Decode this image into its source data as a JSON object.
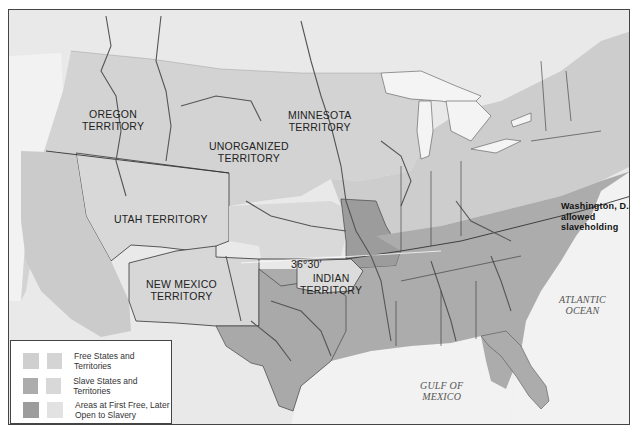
{
  "map": {
    "title_regions": {
      "oregon": "OREGON\nTERRITORY",
      "unorganized": "UNORGANIZED\nTERRITORY",
      "minnesota": "MINNESOTA\nTERRITORY",
      "utah": "UTAH TERRITORY",
      "new_mexico": "NEW MEXICO\nTERRITORY",
      "indian": "INDIAN\nTERRITORY"
    },
    "labels": {
      "oregon_line1": "OREGON",
      "oregon_line2": "TERRITORY",
      "unorganized_line1": "UNORGANIZED",
      "unorganized_line2": "TERRITORY",
      "minnesota_line1": "MINNESOTA",
      "minnesota_line2": "TERRITORY",
      "utah": "UTAH TERRITORY",
      "new_mexico_line1": "NEW MEXICO",
      "new_mexico_line2": "TERRITORY",
      "indian_line1": "INDIAN",
      "indian_line2": "TERRITORY",
      "latitude_line": "36°30′",
      "dc_note_line1": "Washington, D.C.,",
      "dc_note_line2": "allowed",
      "dc_note_line3": "slaveholding",
      "atlantic_line1": "ATLANTIC",
      "atlantic_line2": "OCEAN",
      "gulf_line1": "GULF OF",
      "gulf_line2": "MEXICO"
    },
    "colors": {
      "frame_background": "#e9e9e9",
      "foreign_land": "#e4e4e4",
      "water": "#f2f2f2",
      "free_states": "#cfcfcf",
      "free_territories": "#d6d6d6",
      "slave_states": "#aaaaaa",
      "slave_territories": "#b3b3b3",
      "first_free_later_open": "#c4c4c4",
      "borders": "#333333",
      "rivers": "#555555"
    }
  },
  "legend": {
    "items": [
      {
        "label": "Free States and Territories",
        "swatch_a": "#cfcfcf",
        "swatch_b": "#d4d4d4"
      },
      {
        "label": "Slave States and Territories",
        "swatch_a": "#acacac",
        "swatch_b": "#d8d8d8"
      },
      {
        "label_line1": "Areas at First Free, Later",
        "label_line2": "Open to Slavery",
        "swatch_a": "#9c9c9c",
        "swatch_b": "#e2e2e2"
      }
    ]
  }
}
